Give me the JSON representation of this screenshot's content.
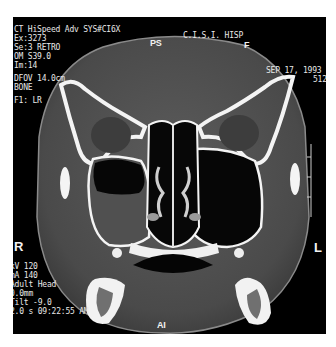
{
  "viewer": {
    "top_left": {
      "cutoff_line": "\u0000\u0000\u0000  \u0000  \u0000\u0000\u0000",
      "scanner": "CT HiSpeed Adv SYS#CI6X",
      "exam": "Ex:3273",
      "series": "Se:3 RETRO",
      "om": "OM S39.0",
      "image": "Im:14",
      "dfov": "DFOV 14.0cm",
      "algorithm": "BONE",
      "filter": "F1: LR"
    },
    "top_center": {
      "orientation_top": "PS",
      "institution": "C.I.S.I. HISP"
    },
    "top_right": {
      "orientation_f": "F",
      "date": "SEP 17, 1993",
      "matrix": "512"
    },
    "orientation": {
      "left": "R",
      "right": "L",
      "bottom": "AI"
    },
    "bottom_left": {
      "kv": "kV 120",
      "ma": "mA 140",
      "protocol": "Adult Head",
      "thickness": "0.0mm",
      "tilt": "Tilt -9.0",
      "time": "2.0 s 09:22:55 AM"
    },
    "colors": {
      "background": "#000000",
      "bone": "#f4f4f4",
      "soft_tissue": "#5a5a5a",
      "air": "#050505",
      "text": "#e8e8e8"
    }
  }
}
